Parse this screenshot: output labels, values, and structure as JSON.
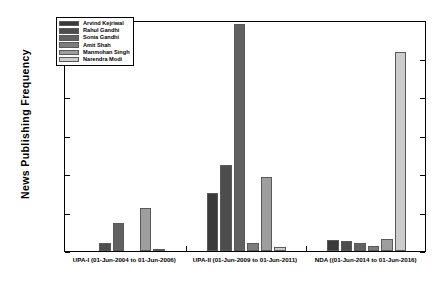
{
  "chart_data": {
    "type": "bar",
    "title": "",
    "xlabel": "",
    "ylabel": "News Publishing Frequency",
    "ylim": [
      0,
      600
    ],
    "yticks": [
      0,
      100,
      200,
      300,
      400,
      500,
      600
    ],
    "grid": false,
    "legend_position": "top-left",
    "categories": [
      "UPA-I (01-Jun-2004 to 01-Jun-2006)",
      "UPA-II (01-Jun-2009 to 01-Jun-2011)",
      "NDA ((01-Jun-2014 to 01-Jun-2016)"
    ],
    "series": [
      {
        "name": "Arvind Kejriwal",
        "color": "#3a3a3a",
        "values": [
          0,
          150,
          28
        ]
      },
      {
        "name": "Rahul Gandhi",
        "color": "#4d4d4d",
        "values": [
          20,
          223,
          27
        ]
      },
      {
        "name": "Sonia Gandhi",
        "color": "#616161",
        "values": [
          72,
          590,
          22
        ]
      },
      {
        "name": "Amit Shah",
        "color": "#7d7d7d",
        "values": [
          0,
          20,
          13
        ]
      },
      {
        "name": "Manmohan Singh",
        "color": "#9e9e9e",
        "values": [
          112,
          191,
          30
        ]
      },
      {
        "name": "Narendra Modi",
        "color": "#cccccc",
        "values": [
          6,
          10,
          516
        ]
      }
    ]
  },
  "axis": {
    "ytick_labels": [
      "0",
      "100",
      "200",
      "300",
      "400",
      "500",
      "600"
    ]
  },
  "legend": {
    "items": [
      "Arvind Kejriwal",
      "Rahul Gandhi",
      "Sonia Gandhi",
      "Amit Shah",
      "Manmohan Singh",
      "Narendra Modi"
    ]
  }
}
